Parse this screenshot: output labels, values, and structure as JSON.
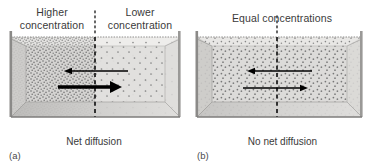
{
  "figure": {
    "background_color": "#ffffff",
    "text_color": "#3a3a3a",
    "arrow_color": "#000000",
    "box_edge_color": "#6f6f6f"
  },
  "panels": [
    {
      "id": "a",
      "letter": "(a)",
      "caption": "Net diffusion",
      "top_labels": [
        {
          "id": "higher",
          "text": "Higher\nconcentration",
          "side": "left"
        },
        {
          "id": "lower",
          "text": "Lower\nconcentration",
          "side": "right"
        }
      ],
      "divider": {
        "style": "dashed",
        "position_pct": 50
      },
      "arrows": [
        {
          "id": "leftward-arrow",
          "direction": "left",
          "weight": "thin",
          "length": "short",
          "meaning": "smaller reverse flux"
        },
        {
          "id": "rightward-arrow",
          "direction": "right",
          "weight": "thick",
          "length": "long",
          "meaning": "larger forward flux"
        }
      ],
      "concentrations": {
        "left": "high",
        "right": "low"
      }
    },
    {
      "id": "b",
      "letter": "(b)",
      "caption": "No net diffusion",
      "top_labels": [
        {
          "id": "equal",
          "text": "Equal concentrations",
          "side": "center"
        }
      ],
      "divider": {
        "style": "dashed",
        "position_pct": 50
      },
      "arrows": [
        {
          "id": "leftward-arrow",
          "direction": "left",
          "weight": "thin",
          "length": "equal",
          "meaning": "flux left"
        },
        {
          "id": "rightward-arrow",
          "direction": "right",
          "weight": "thin",
          "length": "equal",
          "meaning": "flux right"
        }
      ],
      "concentrations": {
        "left": "equal",
        "right": "equal"
      }
    }
  ]
}
